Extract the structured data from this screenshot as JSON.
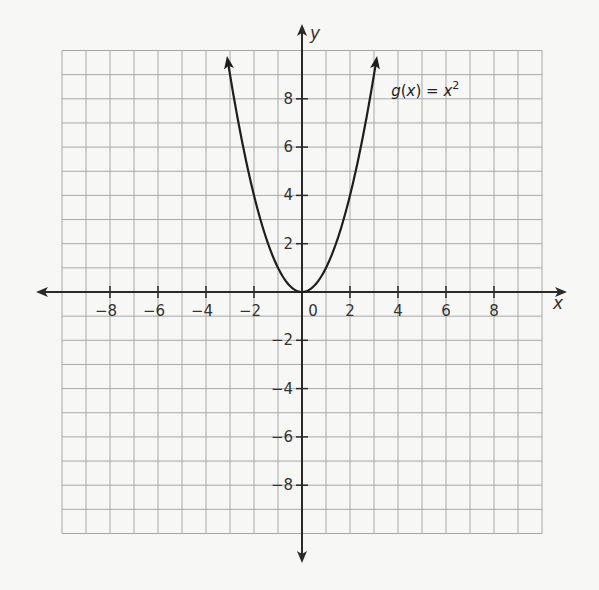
{
  "chart_data": {
    "type": "line",
    "title": "",
    "xlabel": "x",
    "ylabel": "y",
    "xlim": [
      -10,
      10
    ],
    "ylim": [
      -10,
      10
    ],
    "grid": true,
    "grid_step": 1,
    "tick_step": 2,
    "x_ticks": [
      -8,
      -6,
      -4,
      -2,
      0,
      2,
      4,
      6,
      8
    ],
    "y_ticks": [
      -8,
      -6,
      -4,
      -2,
      2,
      4,
      6,
      8
    ],
    "x_tick_labels": [
      "−8",
      "−6",
      "−4",
      "−2",
      "0",
      "2",
      "4",
      "6",
      "8"
    ],
    "y_tick_labels": [
      "−8",
      "−6",
      "−4",
      "−2",
      "2",
      "4",
      "6",
      "8"
    ],
    "axes_arrows": true,
    "series": [
      {
        "name": "g(x) = x²",
        "function": "x^2",
        "x_range": [
          -3.1,
          3.1
        ],
        "arrows_at_ends": true,
        "x": [
          -3.1,
          -3,
          -2.5,
          -2,
          -1.5,
          -1,
          -0.5,
          0,
          0.5,
          1,
          1.5,
          2,
          2.5,
          3,
          3.1
        ],
        "y": [
          9.61,
          9,
          6.25,
          4,
          2.25,
          1,
          0.25,
          0,
          0.25,
          1,
          2.25,
          4,
          6.25,
          9,
          9.61
        ]
      }
    ],
    "annotations": [
      {
        "text_fn": "g",
        "text_arg": "x",
        "text_eq": " = ",
        "text_var": "x",
        "text_exp": "2",
        "x": 3.8,
        "y": 8.4
      }
    ]
  },
  "colors": {
    "background": "#f7f7f6",
    "grid": "#a8a8a8",
    "axis": "#2a2a2a",
    "curve": "#1e1e1e",
    "text": "#333333"
  },
  "labels": {
    "x_axis": "x",
    "y_axis": "y",
    "function_name": "g",
    "function_arg": "x",
    "function_equals": " = ",
    "function_var": "x",
    "function_exp": "2"
  }
}
